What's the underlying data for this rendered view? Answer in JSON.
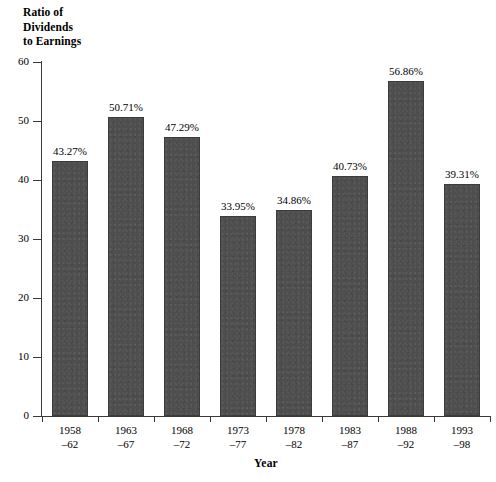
{
  "chart_data": {
    "type": "bar",
    "title": "",
    "xlabel": "Year",
    "ylabel": "Ratio of Dividends to Earnings",
    "ylabel_lines": [
      "Ratio of",
      "Dividends",
      "to Earnings"
    ],
    "categories": [
      "1958–62",
      "1963–67",
      "1968–72",
      "1973–77",
      "1978–82",
      "1983–87",
      "1988–92",
      "1993–98"
    ],
    "category_lines": [
      [
        "1958",
        "–62"
      ],
      [
        "1963",
        "–67"
      ],
      [
        "1968",
        "–72"
      ],
      [
        "1973",
        "–77"
      ],
      [
        "1978",
        "–82"
      ],
      [
        "1983",
        "–87"
      ],
      [
        "1988",
        "–92"
      ],
      [
        "1993",
        "–98"
      ]
    ],
    "values": [
      43.27,
      50.71,
      47.29,
      33.95,
      34.86,
      40.73,
      56.86,
      39.31
    ],
    "data_labels": [
      "43.27%",
      "50.71%",
      "47.29%",
      "33.95%",
      "34.86%",
      "40.73%",
      "56.86%",
      "39.31%"
    ],
    "ylim": [
      0,
      60
    ],
    "yticks": [
      0,
      10,
      20,
      30,
      40,
      50,
      60
    ],
    "ytick_labels": [
      "0",
      "10",
      "20",
      "30",
      "40",
      "50",
      "60"
    ],
    "grid": false,
    "legend": null,
    "bar_color": "#4e4e4e",
    "axis_color": "#3a3a3a",
    "background": "#ffffff"
  }
}
